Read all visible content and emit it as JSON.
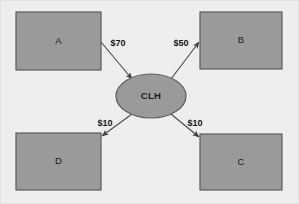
{
  "diagram": {
    "background_color": "#eeeeee",
    "node_fill_color": "#9a9a9a",
    "node_stroke_color": "#5d5d5d",
    "edge_color": "#4a4a4a",
    "hub": {
      "id": "hub",
      "label": "CLH",
      "shape": "ellipse",
      "cx": 151,
      "cy": 96,
      "rx": 35,
      "ry": 22
    },
    "nodes": [
      {
        "id": "a",
        "label": "A",
        "shape": "rect",
        "x": 16,
        "y": 12,
        "w": 85,
        "h": 58
      },
      {
        "id": "b",
        "label": "B",
        "shape": "rect",
        "x": 200,
        "y": 12,
        "w": 82,
        "h": 57
      },
      {
        "id": "d",
        "label": "D",
        "shape": "rect",
        "x": 16,
        "y": 133,
        "w": 85,
        "h": 57
      },
      {
        "id": "c",
        "label": "C",
        "shape": "rect",
        "x": 200,
        "y": 134,
        "w": 82,
        "h": 56
      }
    ],
    "edges": [
      {
        "id": "edge-a-hub",
        "from": "a",
        "to": "hub",
        "label": "$70",
        "label_x": 118,
        "label_y": 44,
        "x1": 101,
        "y1": 42,
        "x2": 132,
        "y2": 79
      },
      {
        "id": "edge-hub-b",
        "from": "hub",
        "to": "b",
        "label": "$50",
        "label_x": 181,
        "label_y": 44,
        "x1": 171,
        "y1": 79,
        "x2": 199,
        "y2": 42
      },
      {
        "id": "edge-hub-d",
        "from": "hub",
        "to": "d",
        "label": "$10",
        "label_x": 105,
        "label_y": 124,
        "x1": 132,
        "y1": 114,
        "x2": 102,
        "y2": 136
      },
      {
        "id": "edge-hub-c",
        "from": "hub",
        "to": "c",
        "label": "$10",
        "label_x": 195,
        "label_y": 124,
        "x1": 171,
        "y1": 114,
        "x2": 199,
        "y2": 137
      }
    ]
  }
}
